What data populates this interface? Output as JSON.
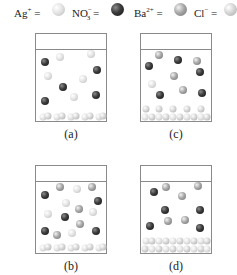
{
  "legend": [
    {
      "ion": "Ag",
      "charge": "+",
      "sub": "",
      "eq": " = ",
      "key": "ag",
      "color": "#e4e4e4"
    },
    {
      "ion": "NO",
      "charge": "−",
      "sub": "3",
      "eq": " = ",
      "key": "no3",
      "color": "#2a2a2a"
    },
    {
      "ion": "Ba",
      "charge": "2+",
      "sub": "",
      "eq": " = ",
      "key": "ba",
      "color": "#9a9a9a"
    },
    {
      "ion": "Cl",
      "charge": "−",
      "sub": "",
      "eq": " = ",
      "key": "cl",
      "color": "#d0d0d0"
    }
  ],
  "panels": [
    {
      "label": "(a)",
      "box": {
        "x": 35,
        "y": 33
      },
      "label_pos": {
        "x": 71,
        "y": 127
      },
      "ions": [
        {
          "t": "no3",
          "x": 45,
          "y": 62
        },
        {
          "t": "ag",
          "x": 60,
          "y": 57
        },
        {
          "t": "ag",
          "x": 91,
          "y": 54
        },
        {
          "t": "no3",
          "x": 97,
          "y": 70
        },
        {
          "t": "ag",
          "x": 48,
          "y": 76
        },
        {
          "t": "ag",
          "x": 83,
          "y": 79
        },
        {
          "t": "no3",
          "x": 63,
          "y": 87
        },
        {
          "t": "ag",
          "x": 74,
          "y": 97
        },
        {
          "t": "no3",
          "x": 96,
          "y": 95
        },
        {
          "t": "no3",
          "x": 45,
          "y": 101
        }
      ],
      "precipitate": [
        {
          "t": "ag",
          "x": 43,
          "y": 117
        },
        {
          "t": "cl",
          "x": 48,
          "y": 116
        },
        {
          "t": "ag",
          "x": 57,
          "y": 117
        },
        {
          "t": "cl",
          "x": 62,
          "y": 116
        },
        {
          "t": "ag",
          "x": 71,
          "y": 117
        },
        {
          "t": "cl",
          "x": 76,
          "y": 116
        },
        {
          "t": "ag",
          "x": 85,
          "y": 117
        },
        {
          "t": "cl",
          "x": 90,
          "y": 116
        },
        {
          "t": "ag",
          "x": 99,
          "y": 117
        },
        {
          "t": "cl",
          "x": 103,
          "y": 116
        }
      ]
    },
    {
      "label": "(c)",
      "box": {
        "x": 140,
        "y": 33
      },
      "label_pos": {
        "x": 176,
        "y": 127
      },
      "ions": [
        {
          "t": "ba",
          "x": 159,
          "y": 55
        },
        {
          "t": "no3",
          "x": 178,
          "y": 60
        },
        {
          "t": "ba",
          "x": 197,
          "y": 61
        },
        {
          "t": "no3",
          "x": 149,
          "y": 66
        },
        {
          "t": "no3",
          "x": 200,
          "y": 72
        },
        {
          "t": "ba",
          "x": 174,
          "y": 76
        },
        {
          "t": "ag",
          "x": 152,
          "y": 84
        },
        {
          "t": "ba",
          "x": 183,
          "y": 90
        },
        {
          "t": "no3",
          "x": 160,
          "y": 95
        },
        {
          "t": "no3",
          "x": 202,
          "y": 93
        }
      ],
      "precipitate": [
        {
          "t": "cl",
          "x": 146,
          "y": 109
        },
        {
          "t": "cl",
          "x": 159,
          "y": 109
        },
        {
          "t": "cl",
          "x": 173,
          "y": 109
        },
        {
          "t": "cl",
          "x": 187,
          "y": 109
        },
        {
          "t": "cl",
          "x": 201,
          "y": 109
        },
        {
          "t": "ag",
          "x": 145,
          "y": 117
        },
        {
          "t": "cl",
          "x": 152,
          "y": 117
        },
        {
          "t": "ag",
          "x": 159,
          "y": 117
        },
        {
          "t": "cl",
          "x": 166,
          "y": 117
        },
        {
          "t": "ag",
          "x": 173,
          "y": 117
        },
        {
          "t": "cl",
          "x": 180,
          "y": 117
        },
        {
          "t": "ag",
          "x": 187,
          "y": 117
        },
        {
          "t": "cl",
          "x": 194,
          "y": 117
        },
        {
          "t": "ag",
          "x": 201,
          "y": 117
        },
        {
          "t": "cl",
          "x": 207,
          "y": 117
        }
      ]
    },
    {
      "label": "(b)",
      "box": {
        "x": 35,
        "y": 165
      },
      "label_pos": {
        "x": 71,
        "y": 259
      },
      "ions": [
        {
          "t": "ba",
          "x": 60,
          "y": 187
        },
        {
          "t": "ag",
          "x": 77,
          "y": 189
        },
        {
          "t": "ba",
          "x": 92,
          "y": 187
        },
        {
          "t": "no3",
          "x": 45,
          "y": 195
        },
        {
          "t": "ag",
          "x": 66,
          "y": 203
        },
        {
          "t": "no3",
          "x": 98,
          "y": 201
        },
        {
          "t": "ba",
          "x": 79,
          "y": 209
        },
        {
          "t": "ag",
          "x": 93,
          "y": 212
        },
        {
          "t": "ag",
          "x": 48,
          "y": 214
        },
        {
          "t": "no3",
          "x": 65,
          "y": 217
        },
        {
          "t": "ba",
          "x": 80,
          "y": 224
        },
        {
          "t": "no3",
          "x": 45,
          "y": 231
        },
        {
          "t": "ba",
          "x": 57,
          "y": 235
        },
        {
          "t": "ag",
          "x": 72,
          "y": 233
        },
        {
          "t": "no3",
          "x": 96,
          "y": 231
        }
      ],
      "precipitate": [
        {
          "t": "ag",
          "x": 43,
          "y": 248
        },
        {
          "t": "cl",
          "x": 48,
          "y": 247
        },
        {
          "t": "ag",
          "x": 57,
          "y": 248
        },
        {
          "t": "cl",
          "x": 62,
          "y": 247
        },
        {
          "t": "ag",
          "x": 71,
          "y": 248
        },
        {
          "t": "cl",
          "x": 76,
          "y": 247
        },
        {
          "t": "ag",
          "x": 85,
          "y": 248
        },
        {
          "t": "cl",
          "x": 90,
          "y": 247
        },
        {
          "t": "ag",
          "x": 99,
          "y": 248
        },
        {
          "t": "cl",
          "x": 103,
          "y": 247
        }
      ]
    },
    {
      "label": "(d)",
      "box": {
        "x": 140,
        "y": 165
      },
      "label_pos": {
        "x": 176,
        "y": 259
      },
      "ions": [
        {
          "t": "no3",
          "x": 154,
          "y": 192
        },
        {
          "t": "ba",
          "x": 166,
          "y": 187
        },
        {
          "t": "ba",
          "x": 198,
          "y": 186
        },
        {
          "t": "ba",
          "x": 182,
          "y": 196
        },
        {
          "t": "no3",
          "x": 165,
          "y": 210
        },
        {
          "t": "no3",
          "x": 200,
          "y": 210
        },
        {
          "t": "no3",
          "x": 150,
          "y": 226
        },
        {
          "t": "ba",
          "x": 168,
          "y": 221
        },
        {
          "t": "ba",
          "x": 185,
          "y": 220
        },
        {
          "t": "no3",
          "x": 200,
          "y": 228
        }
      ],
      "precipitate": [
        {
          "t": "ag",
          "x": 146,
          "y": 241
        },
        {
          "t": "cl",
          "x": 152,
          "y": 241
        },
        {
          "t": "ag",
          "x": 159,
          "y": 241
        },
        {
          "t": "cl",
          "x": 166,
          "y": 241
        },
        {
          "t": "ag",
          "x": 173,
          "y": 241
        },
        {
          "t": "cl",
          "x": 180,
          "y": 241
        },
        {
          "t": "ag",
          "x": 187,
          "y": 241
        },
        {
          "t": "cl",
          "x": 194,
          "y": 241
        },
        {
          "t": "ag",
          "x": 201,
          "y": 241
        },
        {
          "t": "cl",
          "x": 207,
          "y": 241
        },
        {
          "t": "cl",
          "x": 145,
          "y": 249
        },
        {
          "t": "ag",
          "x": 152,
          "y": 249
        },
        {
          "t": "cl",
          "x": 159,
          "y": 249
        },
        {
          "t": "ag",
          "x": 166,
          "y": 249
        },
        {
          "t": "cl",
          "x": 173,
          "y": 249
        },
        {
          "t": "ag",
          "x": 180,
          "y": 249
        },
        {
          "t": "cl",
          "x": 187,
          "y": 249
        },
        {
          "t": "ag",
          "x": 194,
          "y": 249
        },
        {
          "t": "cl",
          "x": 201,
          "y": 249
        },
        {
          "t": "ag",
          "x": 207,
          "y": 249
        }
      ]
    }
  ]
}
